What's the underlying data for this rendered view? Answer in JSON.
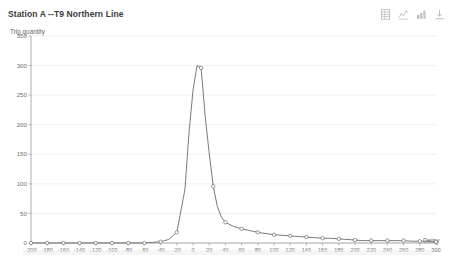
{
  "header": {
    "title": "Station A --T9 Northern Line"
  },
  "toolbar": {
    "items": [
      {
        "icon": "data-view-icon",
        "label": "View data"
      },
      {
        "icon": "line-chart-icon",
        "label": "Switch to line chart"
      },
      {
        "icon": "bar-chart-icon",
        "label": "Switch to bar chart"
      },
      {
        "icon": "download-icon",
        "label": "Save as image"
      }
    ]
  },
  "chart_data": {
    "type": "line",
    "title": "Station A --T9 Northern Line",
    "xlabel": "Delay",
    "ylabel": "Trip quantity",
    "xlim": [
      -200,
      300
    ],
    "ylim": [
      0,
      350
    ],
    "grid": true,
    "legend": null,
    "yticks": [
      0,
      50,
      100,
      150,
      200,
      250,
      300,
      350
    ],
    "xticks": [
      -200,
      -180,
      -160,
      -140,
      -120,
      -100,
      -80,
      -60,
      -40,
      -20,
      0,
      20,
      40,
      60,
      80,
      100,
      120,
      140,
      160,
      180,
      200,
      220,
      240,
      260,
      280,
      300
    ],
    "x": [
      -200,
      -190,
      -180,
      -170,
      -160,
      -150,
      -140,
      -130,
      -120,
      -110,
      -100,
      -90,
      -80,
      -70,
      -60,
      -50,
      -40,
      -30,
      -20,
      -10,
      -5,
      0,
      5,
      10,
      15,
      20,
      25,
      30,
      35,
      40,
      50,
      60,
      70,
      80,
      90,
      100,
      110,
      120,
      130,
      140,
      150,
      160,
      170,
      180,
      190,
      200,
      210,
      220,
      230,
      240,
      250,
      260,
      270,
      280,
      290,
      300
    ],
    "values": [
      0,
      0,
      0,
      0,
      0,
      0,
      0,
      0,
      0,
      0,
      0,
      0,
      0,
      0,
      0,
      1,
      2,
      6,
      18,
      90,
      185,
      258,
      300,
      296,
      215,
      152,
      96,
      62,
      44,
      35,
      28,
      24,
      21,
      18,
      16,
      14,
      13,
      12,
      11,
      10,
      9,
      8,
      8,
      7,
      6,
      5,
      4,
      4,
      4,
      4,
      4,
      4,
      3,
      3,
      3,
      2
    ],
    "marker_x": [
      -200,
      -180,
      -160,
      -140,
      -120,
      -100,
      -80,
      -60,
      -40,
      -20,
      10,
      25,
      40,
      60,
      80,
      100,
      120,
      140,
      160,
      180,
      200,
      220,
      240,
      260,
      280,
      300
    ],
    "marker_values": [
      0,
      0,
      0,
      0,
      0,
      0,
      0,
      0,
      2,
      18,
      296,
      96,
      35,
      24,
      18,
      14,
      12,
      10,
      8,
      7,
      5,
      4,
      4,
      4,
      3,
      2
    ],
    "series": [
      {
        "name": "Trip quantity",
        "color": "#6b6b6b"
      }
    ]
  },
  "axes": {
    "ytick_labels": [
      "0",
      "50",
      "100",
      "150",
      "200",
      "250",
      "300",
      "350"
    ],
    "xtick_labels": [
      "-200",
      "-180",
      "-160",
      "-140",
      "-120",
      "-100",
      "-80",
      "-60",
      "-40",
      "-20",
      "0",
      "20",
      "40",
      "60",
      "80",
      "100",
      "120",
      "140",
      "160",
      "180",
      "200",
      "220",
      "240",
      "260",
      "280",
      "300"
    ]
  },
  "colors": {
    "series": "#6b6b6b",
    "grid": "#e8e8e8",
    "axis": "#9a9a9a",
    "text": "#707070",
    "title": "#3a3a3a",
    "background": "#ffffff"
  }
}
